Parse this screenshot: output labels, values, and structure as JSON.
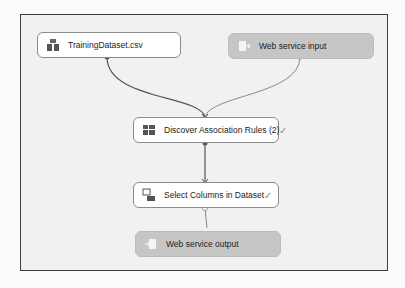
{
  "nodes": {
    "training_dataset": {
      "label": "TrainingDataset.csv",
      "icon": "dataset-icon"
    },
    "web_service_input": {
      "label": "Web service input",
      "icon": "web-service-input-icon"
    },
    "discover_rules": {
      "label": "Discover Association Rules (2)",
      "icon": "grid-module-icon",
      "status": "✓"
    },
    "select_columns": {
      "label": "Select Columns in Dataset",
      "icon": "select-columns-icon",
      "status": "✓"
    },
    "web_service_output": {
      "label": "Web service output",
      "icon": "web-service-output-icon"
    }
  },
  "colors": {
    "module_bg": "#ffffff",
    "web_service_bg": "#c6c6c6",
    "wire": "#555555"
  }
}
